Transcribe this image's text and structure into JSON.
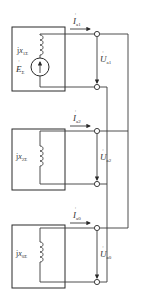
{
  "diagram": {
    "type": "sequence-network-connection",
    "colors": {
      "line": "#3a3a3a",
      "background": "#ffffff"
    },
    "networks": [
      {
        "name": "positive-sequence",
        "reactance_label": "jx",
        "reactance_sub": "1Σ",
        "source_label": "E",
        "source_sub": "Σ",
        "current_label": "I",
        "current_sub": "a1",
        "voltage_label": "U",
        "voltage_sub": "a1"
      },
      {
        "name": "negative-sequence",
        "reactance_label": "jx",
        "reactance_sub": "2Σ",
        "current_label": "I",
        "current_sub": "a2",
        "voltage_label": "U",
        "voltage_sub": "a2"
      },
      {
        "name": "zero-sequence",
        "reactance_label": "jx",
        "reactance_sub": "0Σ",
        "current_label": "I",
        "current_sub": "a0",
        "voltage_label": "U",
        "voltage_sub": "a0"
      }
    ]
  }
}
